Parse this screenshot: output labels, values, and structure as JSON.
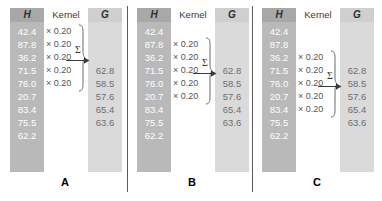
{
  "figure": {
    "headers": {
      "input": "H",
      "kernel": "Kernel",
      "output": "G"
    },
    "colors": {
      "input_column": "#b9b9b9",
      "input_header": "#a8a8a8",
      "output_column": "#dadada",
      "output_header": "#cfcfcf",
      "divider": "#5b5b5b",
      "input_text": "#ffffff",
      "output_text": "#6e6e6e",
      "kernel_text": "#555555"
    },
    "input_values": [
      "42.4",
      "87.8",
      "36.2",
      "71.5",
      "76.0",
      "20.7",
      "83.4",
      "75.5",
      "62.2"
    ],
    "output_values": [
      "62.8",
      "58.5",
      "57.6",
      "65.4",
      "63.6"
    ],
    "kernel_weight": "× 0.20",
    "kernel_size": 5,
    "sum_symbol": "Σ",
    "panels": [
      {
        "caption": "A",
        "kernel_start_row": 0,
        "output_row": 0,
        "kernel_weights": [
          "× 0.20",
          "× 0.20",
          "× 0.20",
          "× 0.20",
          "× 0.20"
        ],
        "result": "62.8"
      },
      {
        "caption": "B",
        "kernel_start_row": 1,
        "output_row": 1,
        "kernel_weights": [
          "× 0.20",
          "× 0.20",
          "× 0.20",
          "× 0.20",
          "× 0.20"
        ],
        "result": "58.5"
      },
      {
        "caption": "C",
        "kernel_start_row": 2,
        "output_row": 2,
        "kernel_weights": [
          "× 0.20",
          "× 0.20",
          "× 0.20",
          "× 0.20",
          "× 0.20"
        ],
        "result": "57.6"
      }
    ]
  }
}
